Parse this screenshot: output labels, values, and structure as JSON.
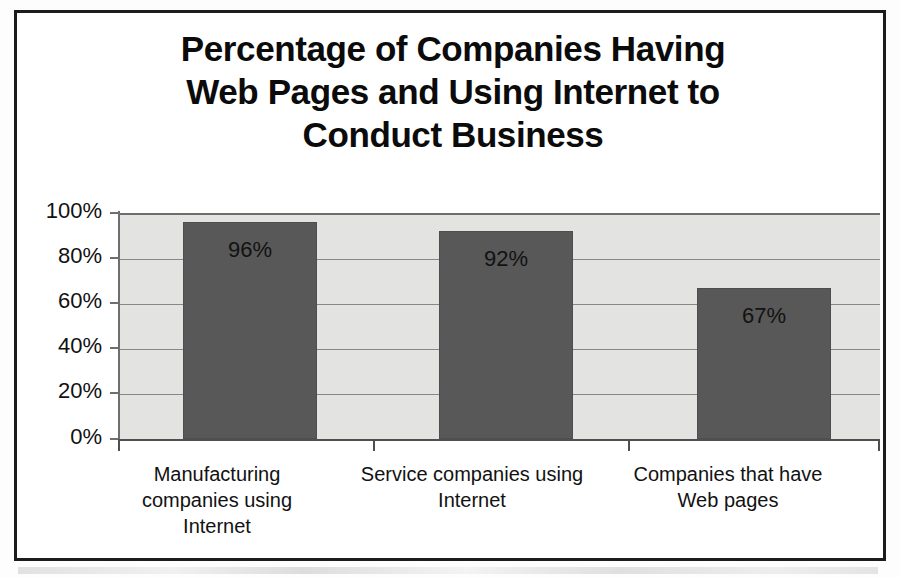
{
  "chart_data": {
    "type": "bar",
    "title": "Percentage of Companies Having Web Pages and Using Internet to Conduct Business",
    "title_lines": [
      "Percentage of Companies Having",
      "Web Pages and Using Internet to",
      "Conduct Business"
    ],
    "categories": [
      "Manufacturing companies using Internet",
      "Service companies using Internet",
      "Companies that have Web pages"
    ],
    "category_label_lines": [
      [
        "Manufacturing",
        "companies using",
        "Internet"
      ],
      [
        "Service companies using",
        "Internet"
      ],
      [
        "Companies that have",
        "Web pages"
      ]
    ],
    "values": [
      96,
      92,
      67
    ],
    "data_labels": [
      "96%",
      "92%",
      "67%"
    ],
    "xlabel": "",
    "ylabel": "",
    "ylim": [
      0,
      100
    ],
    "y_tick_values": [
      100,
      80,
      60,
      40,
      20,
      0
    ],
    "y_tick_labels": [
      "100%",
      "80%",
      "60%",
      "40%",
      "20%",
      "0%"
    ],
    "grid": true,
    "legend": false,
    "colors": {
      "bar_fill": "#585858",
      "bar_border": "#4e4e4e",
      "plot_background": "#e3e3e1",
      "gridline": "#878787",
      "axis": "#4f4f4f",
      "text": "#121212",
      "frame": "#1c1c1c"
    }
  }
}
